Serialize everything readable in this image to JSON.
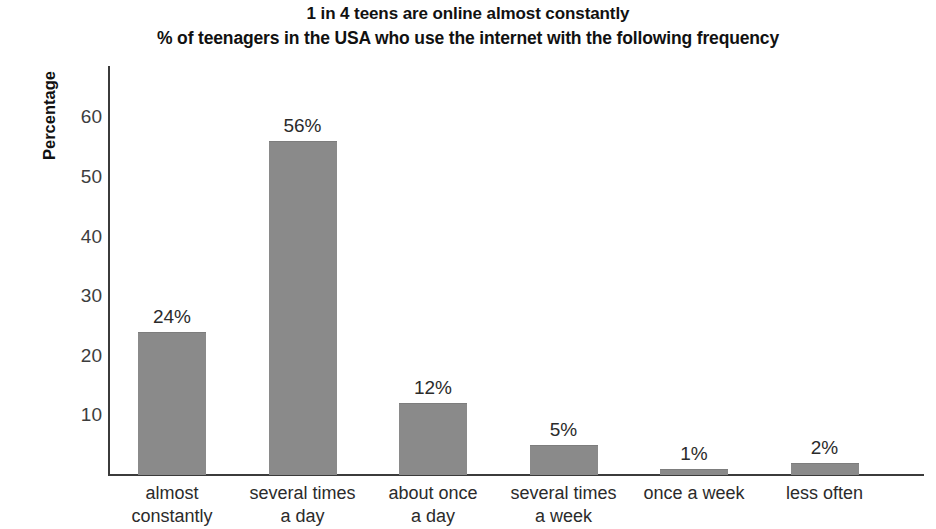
{
  "chart_data": {
    "type": "bar",
    "title": "1 in 4 teens are online almost constantly",
    "subtitle": "% of teenagers in the USA who use the internet with the following frequency",
    "xlabel": "",
    "ylabel": "Percentage",
    "ylim": [
      0,
      66
    ],
    "yticks": [
      10,
      20,
      30,
      40,
      50,
      60
    ],
    "ytick_labels": [
      "10",
      "20",
      "30",
      "40",
      "50",
      "60"
    ],
    "grid": false,
    "legend": false,
    "bar_color": "#8a8a8a",
    "categories": [
      "almost constantly",
      "several times a day",
      "about once a day",
      "several times a week",
      "once a week",
      "less often"
    ],
    "category_lines": [
      [
        "almost",
        "constantly"
      ],
      [
        "several times",
        "a day"
      ],
      [
        "about once",
        "a day"
      ],
      [
        "several times",
        "a week"
      ],
      [
        "once a week"
      ],
      [
        "less often"
      ]
    ],
    "values": [
      24,
      56,
      12,
      5,
      1,
      2
    ],
    "value_labels": [
      "24%",
      "56%",
      "12%",
      "5%",
      "1%",
      "2%"
    ]
  }
}
